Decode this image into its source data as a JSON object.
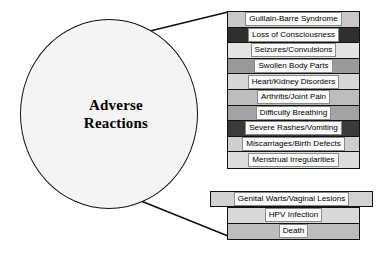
{
  "diagram": {
    "title_node": {
      "label": "Adverse\nReactions",
      "shape": "circle",
      "fill_color": "#f4f4f4",
      "stroke_color": "#111111"
    },
    "column_rows": [
      {
        "label": "Guillain-Barre Syndrome",
        "band_color": "#c9c9c9"
      },
      {
        "label": "Loss of Consciousness",
        "band_color": "#2f2f2f"
      },
      {
        "label": "Seizures/Convulsions",
        "band_color": "#e3e3e3"
      },
      {
        "label": "Swollen Body Parts",
        "band_color": "#9a9a9a"
      },
      {
        "label": "Heart/Kidney Disorders",
        "band_color": "#d7d7d7"
      },
      {
        "label": "Arthritis/Joint Pain",
        "band_color": "#bdbdbd"
      },
      {
        "label": "Difficulty Breathing",
        "band_color": "#a3a3a3"
      },
      {
        "label": "Severe Rashes/Vomiting",
        "band_color": "#3a3a3a"
      },
      {
        "label": "Miscarriages/Birth Defects",
        "band_color": "#cfcfcf"
      },
      {
        "label": "Menstrual Irregularities",
        "band_color": "#dcdcdc"
      }
    ],
    "wide_row": {
      "label": "Genital Warts/Vaginal Lesions",
      "band_color": "#d2d2d2"
    },
    "bottom_rows": [
      {
        "label": "HPV Infection",
        "band_color": "#d9d9d9"
      },
      {
        "label": "Death",
        "band_color": "#bdbdbd"
      }
    ],
    "chip_fill": "#fbfbfb",
    "chip_border": "#8a8a8a",
    "connector_color": "#111111"
  }
}
